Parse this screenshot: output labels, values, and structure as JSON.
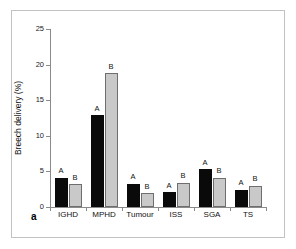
{
  "figure": {
    "panel_label": "a",
    "frame_color": "#c2c2c2",
    "background": "#ffffff"
  },
  "chart_data": {
    "type": "bar",
    "title": "",
    "xlabel": "",
    "ylabel": "Breech delivery (%)",
    "ylim": [
      0,
      25
    ],
    "yticks": [
      0,
      5,
      10,
      15,
      20,
      25
    ],
    "ytick_labels": [
      "0",
      "5",
      "10",
      "15",
      "20",
      "25"
    ],
    "grid": false,
    "legend": "none",
    "categories": [
      "IGHD",
      "MPHD",
      "Tumour",
      "ISS",
      "SGA",
      "TS"
    ],
    "series": [
      {
        "name": "A",
        "color": "#0a0a0a",
        "values": [
          4.1,
          12.9,
          3.3,
          2.1,
          5.3,
          2.4
        ]
      },
      {
        "name": "B",
        "color": "#c9c9c9",
        "values": [
          3.2,
          18.8,
          1.9,
          3.4,
          4.1,
          3.0
        ]
      }
    ],
    "bar_annotations": [
      [
        "A",
        "B"
      ],
      [
        "A",
        "B"
      ],
      [
        "A",
        "B"
      ],
      [
        "A",
        "B"
      ],
      [
        "A",
        "B"
      ],
      [
        "A",
        "B"
      ]
    ]
  }
}
